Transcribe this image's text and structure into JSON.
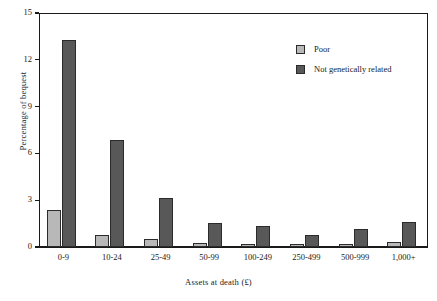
{
  "chart_data": {
    "type": "bar",
    "title": "",
    "xlabel": "Assets at death (£)",
    "ylabel": "Percentage of bequest",
    "categories": [
      "0-9",
      "10-24",
      "25-49",
      "50-99",
      "100-249",
      "250-499",
      "500-999",
      "1,000+"
    ],
    "series": [
      {
        "name": "Poor",
        "color": "#b8b8b8",
        "values": [
          2.35,
          0.8,
          0.5,
          0.25,
          0.2,
          0.2,
          0.2,
          0.3
        ]
      },
      {
        "name": "Not genetically related",
        "color": "#585858",
        "values": [
          13.25,
          6.85,
          3.15,
          1.55,
          1.35,
          0.8,
          1.15,
          1.6
        ]
      }
    ],
    "yticks": [
      0,
      3,
      6,
      9,
      12,
      15
    ],
    "ylim": [
      0,
      15
    ],
    "grid": false,
    "legend_position": "top-right",
    "axis_color": "#1a1a1a"
  },
  "legend": {
    "items": [
      {
        "label": "Poor"
      },
      {
        "label": "Not genetically related"
      }
    ]
  }
}
